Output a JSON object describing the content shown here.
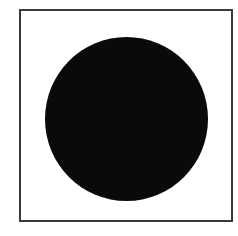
{
  "figure": {
    "frame": {
      "shape": "square-outline",
      "border_color": "#3a3a3a",
      "fill_color": "#ffffff"
    },
    "disc": {
      "shape": "filled-circle",
      "fill_color": "#0a0a0a",
      "center": [
        126,
        119
      ],
      "radius": 81
    },
    "background_color": "#ffffff"
  }
}
